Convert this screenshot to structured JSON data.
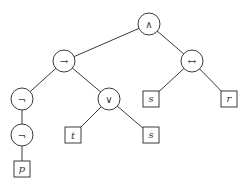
{
  "diagram": {
    "type": "syntax-tree",
    "nodes": [
      {
        "id": "and",
        "label": "∧",
        "shape": "circle",
        "x": 149,
        "y": 24
      },
      {
        "id": "imp",
        "label": "→",
        "shape": "circle",
        "x": 64,
        "y": 61
      },
      {
        "id": "iff",
        "label": "↔",
        "shape": "circle",
        "x": 192,
        "y": 61
      },
      {
        "id": "neg1",
        "label": "¬",
        "shape": "circle",
        "x": 22,
        "y": 99
      },
      {
        "id": "or",
        "label": "∨",
        "shape": "circle",
        "x": 109,
        "y": 99
      },
      {
        "id": "s1",
        "label": "s",
        "shape": "square",
        "x": 151,
        "y": 99
      },
      {
        "id": "r",
        "label": "r",
        "shape": "square",
        "x": 229,
        "y": 99
      },
      {
        "id": "neg2",
        "label": "¬",
        "shape": "circle",
        "x": 22,
        "y": 135
      },
      {
        "id": "t",
        "label": "t",
        "shape": "square",
        "x": 73,
        "y": 135
      },
      {
        "id": "s2",
        "label": "s",
        "shape": "square",
        "x": 151,
        "y": 135
      },
      {
        "id": "p",
        "label": "p",
        "shape": "square",
        "x": 22,
        "y": 169
      }
    ],
    "edges": [
      [
        "and",
        "imp"
      ],
      [
        "and",
        "iff"
      ],
      [
        "imp",
        "neg1"
      ],
      [
        "imp",
        "or"
      ],
      [
        "iff",
        "s1"
      ],
      [
        "iff",
        "r"
      ],
      [
        "neg1",
        "neg2"
      ],
      [
        "neg2",
        "p"
      ],
      [
        "or",
        "t"
      ],
      [
        "or",
        "s2"
      ]
    ]
  }
}
